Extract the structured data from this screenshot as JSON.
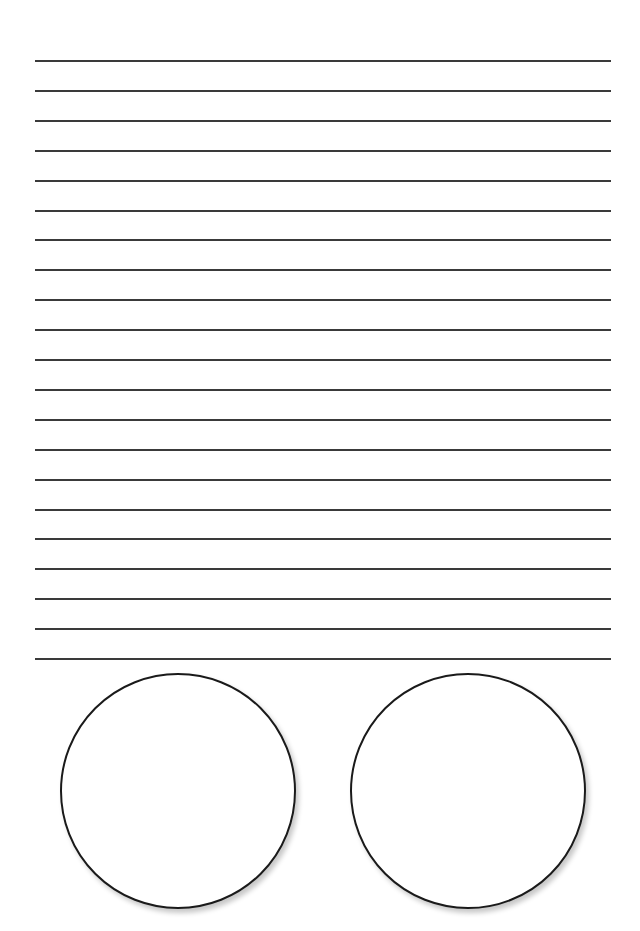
{
  "worksheet": {
    "ruled_lines": {
      "count": 21,
      "first_y": 60,
      "spacing": 29.9,
      "x_start": 35,
      "x_end": 611,
      "color": "#3a3a3a"
    },
    "circles": [
      {
        "name": "left-circle",
        "cx": 178,
        "cy": 791,
        "diameter": 236
      },
      {
        "name": "right-circle",
        "cx": 468,
        "cy": 791,
        "diameter": 236
      }
    ]
  }
}
